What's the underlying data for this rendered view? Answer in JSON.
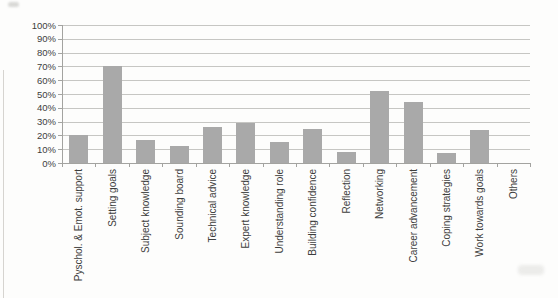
{
  "chart_data": {
    "type": "bar",
    "title": "",
    "xlabel": "",
    "ylabel": "",
    "categories": [
      "Pyschol. & Emot. support",
      "Setting goals",
      "Subject knowledge",
      "Sounding board",
      "Technical advice",
      "Expert knowledge",
      "Understanding role",
      "Building confidence",
      "Reflection",
      "Networking",
      "Career advancement",
      "Coping strategies",
      "Work towards goals",
      "Others"
    ],
    "values": [
      20,
      70,
      17,
      12,
      26,
      29,
      15,
      25,
      8,
      52,
      44,
      7,
      24,
      0
    ],
    "ylim": [
      0,
      100
    ],
    "ytick_step": 10,
    "ytick_labels": [
      "0%",
      "10%",
      "20%",
      "30%",
      "40%",
      "50%",
      "60%",
      "70%",
      "80%",
      "90%",
      "100%"
    ],
    "grid": true,
    "legend": false,
    "bar_color": "#a9a9a9",
    "gridline_color": "#c6c6c3",
    "axis_color": "#a3a3a0",
    "text_color": "#3d3d3d"
  }
}
